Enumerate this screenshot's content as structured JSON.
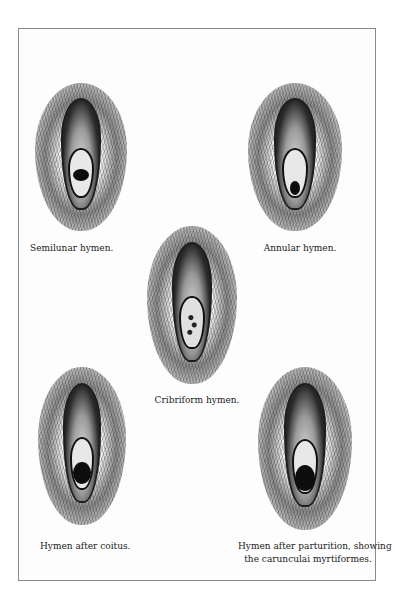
{
  "plate": {
    "figures": [
      {
        "id": "semilunar",
        "caption": "Semilunar hymen."
      },
      {
        "id": "annular",
        "caption": "Annular hymen."
      },
      {
        "id": "cribriform",
        "caption": "Cribriform hymen."
      },
      {
        "id": "after-coitus",
        "caption": "Hymen after coitus."
      },
      {
        "id": "after-parturition",
        "caption_line1": "Hymen after parturition, showing",
        "caption_line2": "the carunculai myrtiformes."
      }
    ]
  },
  "colors": {
    "border": "#8a8a8a",
    "ink": "#222222",
    "background": "#ffffff"
  }
}
